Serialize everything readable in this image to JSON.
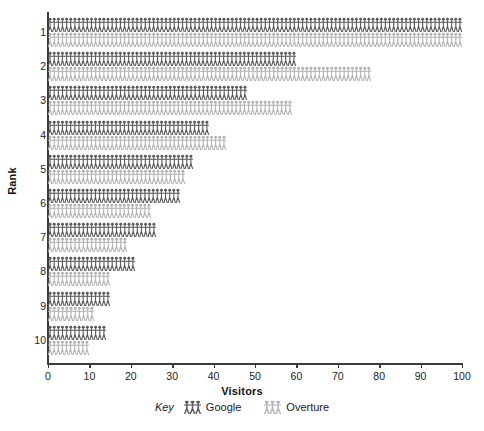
{
  "chart_data": {
    "type": "bar",
    "subtype": "pictogram",
    "title": "",
    "xlabel": "Visitors",
    "ylabel": "Rank",
    "categories": [
      "1",
      "2",
      "3",
      "4",
      "5",
      "6",
      "7",
      "8",
      "9",
      "10"
    ],
    "series": [
      {
        "name": "Google",
        "color": "#5a5a5a",
        "values": [
          100,
          60,
          48,
          39,
          35,
          32,
          26,
          21,
          15,
          14
        ]
      },
      {
        "name": "Overture",
        "color": "#b3b3b3",
        "values": [
          100,
          78,
          59,
          43,
          33,
          25,
          19,
          15,
          11,
          10
        ]
      }
    ],
    "xlim": [
      0,
      100
    ],
    "xticks": [
      0,
      10,
      20,
      30,
      40,
      50,
      60,
      70,
      80,
      90,
      100
    ],
    "yticks": [
      "1",
      "2",
      "3",
      "4",
      "5",
      "6",
      "7",
      "8",
      "9",
      "10"
    ],
    "grid": false,
    "legend_position": "bottom",
    "legend_prefix": "Key",
    "unit_per_icon": 1,
    "icon": "person-figure-icon"
  },
  "axes": {
    "x_title": "Visitors",
    "y_title": "Rank"
  },
  "legend": {
    "prefix": "Key",
    "entries": [
      {
        "label": "Google",
        "color": "#5a5a5a"
      },
      {
        "label": "Overture",
        "color": "#b3b3b3"
      }
    ]
  },
  "colors": {
    "google": "#5a5a5a",
    "overture": "#b3b3b3",
    "axis": "#3a3a3a",
    "background": "#ffffff"
  }
}
